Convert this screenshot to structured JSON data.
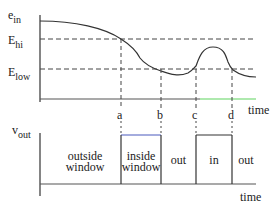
{
  "top_plot": {
    "y_label_main": "e",
    "y_label_sub": "in",
    "threshold_hi_main": "E",
    "threshold_hi_sub": "hi",
    "threshold_low_main": "E",
    "threshold_low_sub": "low",
    "x_axis_label": "time",
    "markers": [
      "a",
      "b",
      "c",
      "d"
    ]
  },
  "bottom_plot": {
    "y_label_main": "v",
    "y_label_sub": "out",
    "x_axis_label": "time",
    "regions": [
      {
        "label_line1": "outside",
        "label_line2": "window"
      },
      {
        "label_line1": "inside",
        "label_line2": "window"
      },
      {
        "label_line1": "out",
        "label_line2": ""
      },
      {
        "label_line1": "in",
        "label_line2": ""
      },
      {
        "label_line1": "out",
        "label_line2": ""
      }
    ]
  },
  "colors": {
    "line": "#333333",
    "dashed": "#444444",
    "accent_green": "#5fd35f",
    "accent_blue": "#4a5bbd"
  }
}
